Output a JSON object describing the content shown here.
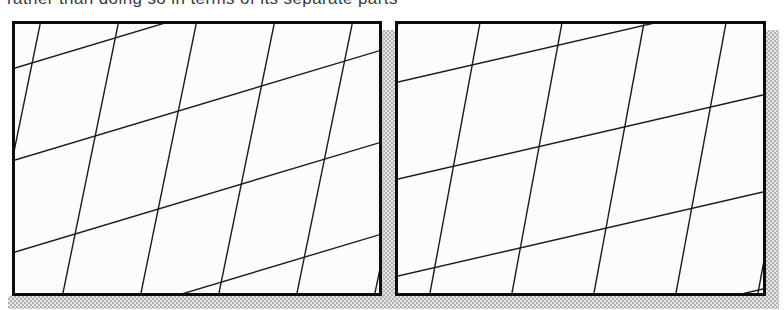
{
  "figure": {
    "caption": {
      "text": "rather than doing so in terms of its separate parts",
      "x": 7,
      "width": 430,
      "color": "#3a3a3a"
    },
    "colors": {
      "page_bg": "#ffffff",
      "panel_bg": "#fcfcfc",
      "border": "#0d0d0d",
      "hatch_line": "#1c1c1c",
      "shadow_dark": "#b4b4b4",
      "shadow_light": "#e4e4e4"
    },
    "panels": [
      {
        "id": "left",
        "x": 12,
        "y": 21,
        "w": 370,
        "h": 275,
        "border_px": 3,
        "steep_lines": {
          "lean_tangent": 0.205,
          "period_px": 78,
          "phase_px": 48
        },
        "shallow_lines": {
          "rise_tangent": 0.3,
          "spacing_px": 92,
          "phase_px": 44
        },
        "line_width": 1.4
      },
      {
        "id": "right",
        "x": 395,
        "y": 21,
        "w": 371,
        "h": 275,
        "border_px": 3,
        "steep_lines": {
          "lean_tangent": 0.185,
          "period_px": 82,
          "phase_px": 32
        },
        "shallow_lines": {
          "rise_tangent": 0.23,
          "spacing_px": 97,
          "phase_px": 58
        },
        "line_width": 1.4
      }
    ],
    "shadows": [
      {
        "name": "shadow-band-bottom",
        "x": 8,
        "y": 296,
        "w": 771,
        "h": 13
      },
      {
        "name": "shadow-strip-gap",
        "x": 381,
        "y": 30,
        "w": 14,
        "h": 267
      },
      {
        "name": "shadow-strip-right",
        "x": 766,
        "y": 30,
        "w": 13,
        "h": 267
      }
    ]
  }
}
